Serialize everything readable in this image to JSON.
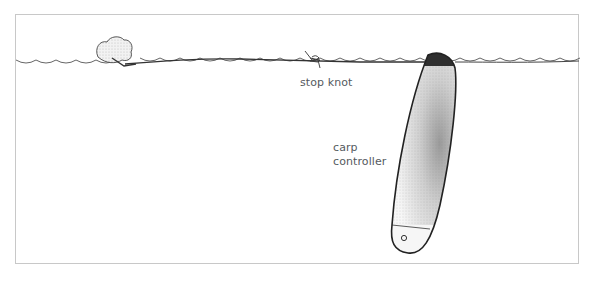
{
  "diagram": {
    "type": "fishing-rig-illustration",
    "labels": {
      "stop_knot": "stop knot",
      "carp_controller_line1": "carp",
      "carp_controller_line2": "controller"
    },
    "elements": [
      "water-surface",
      "bread-crust-bait",
      "fishing-line",
      "stop-knot",
      "carp-controller-float"
    ],
    "colors": {
      "line": "#333333",
      "frame": "#c8c8c8",
      "label": "#555a60",
      "float_tip": "#2a2a2a"
    }
  }
}
